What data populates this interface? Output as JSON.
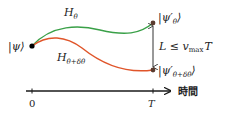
{
  "diagram": {
    "colors": {
      "upper_path": "#3aa048",
      "lower_path": "#e0552a",
      "axis": "#1a1a1a",
      "points": "#5a3b2e",
      "start_point": "#000000"
    },
    "start_state": {
      "label": "|ψ⟩"
    },
    "upper_path": {
      "hamiltonian_label": "H",
      "hamiltonian_sub": "θ"
    },
    "lower_path": {
      "hamiltonian_label": "H",
      "hamiltonian_sub": "θ+δθ"
    },
    "end_states": {
      "upper": {
        "label": "|ψ′",
        "sub": "θ",
        "close": "⟩"
      },
      "lower": {
        "label": "|ψ′",
        "sub": "θ+δθ",
        "close": "⟩"
      }
    },
    "distance_bound": {
      "lhs": "L ≤ v",
      "sub": "max",
      "rhs": "T"
    },
    "time_axis": {
      "label": "時間",
      "ticks": [
        {
          "label": "0"
        },
        {
          "label": "T"
        }
      ]
    }
  }
}
